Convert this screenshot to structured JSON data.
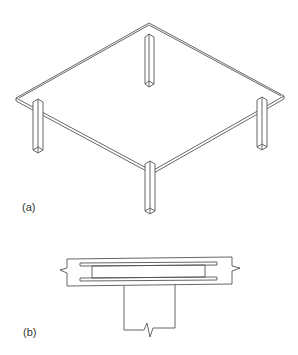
{
  "figure": {
    "panels": [
      {
        "id": "a",
        "label": "(a)",
        "description": "Isometric view of flat plate slab supported on four columns"
      },
      {
        "id": "b",
        "label": "(b)",
        "description": "Section through slab and column with embedded shearhead (steel I-section)"
      }
    ]
  },
  "colors": {
    "stroke": "#555555",
    "background": "#ffffff"
  }
}
